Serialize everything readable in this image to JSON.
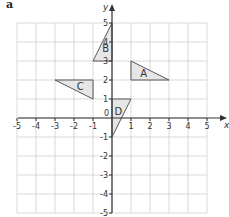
{
  "figure": {
    "part_label": "a",
    "x_axis_label": "x",
    "y_axis_label": "y",
    "origin_label": "0",
    "x_ticks": [
      "-5",
      "-4",
      "-3",
      "-2",
      "-1",
      "1",
      "2",
      "3",
      "4",
      "5"
    ],
    "y_ticks": [
      "5",
      "4",
      "3",
      "2",
      "1",
      "-1",
      "-2",
      "-3",
      "-4",
      "-5"
    ],
    "range": {
      "xmin": -5,
      "xmax": 5,
      "ymin": -5,
      "ymax": 5
    },
    "colors": {
      "grid": "#cfcfcf",
      "axis": "#333333",
      "shape_fill": "#e6e6e6",
      "shape_stroke": "#555555",
      "text": "#333333"
    },
    "shapes": [
      {
        "label": "A",
        "vertices": [
          [
            1,
            3
          ],
          [
            1,
            2
          ],
          [
            3,
            2
          ]
        ]
      },
      {
        "label": "B",
        "vertices": [
          [
            -1,
            3
          ],
          [
            0,
            3
          ],
          [
            0,
            5
          ]
        ]
      },
      {
        "label": "C",
        "vertices": [
          [
            -3,
            2
          ],
          [
            -1,
            2
          ],
          [
            -1,
            1
          ]
        ]
      },
      {
        "label": "D",
        "vertices": [
          [
            0,
            1
          ],
          [
            1,
            1
          ],
          [
            0,
            -1
          ]
        ]
      }
    ]
  }
}
